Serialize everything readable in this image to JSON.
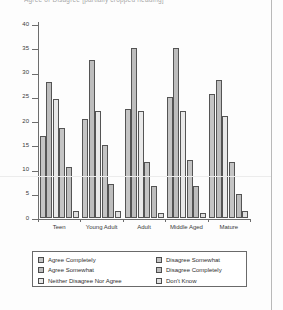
{
  "title_fragment": "Agree or Disagree [partially cropped heading]",
  "chart_data": {
    "type": "bar",
    "title": "Agree or Disagree [partially cropped heading]",
    "xlabel": "",
    "ylabel": "",
    "ylim": [
      0,
      40
    ],
    "yticks": [
      0,
      5,
      10,
      15,
      20,
      25,
      30,
      35,
      40
    ],
    "grid": false,
    "legend_position": "bottom",
    "categories": [
      "Teen",
      "Young Adult",
      "Adult",
      "Middle Aged",
      "Mature"
    ],
    "series": [
      {
        "name": "Agree Completely",
        "values": [
          17,
          20.5,
          22.5,
          25,
          25.5
        ]
      },
      {
        "name": "Agree Somewhat",
        "values": [
          28,
          32.5,
          35,
          35,
          28.5
        ]
      },
      {
        "name": "Neither Disagree Nor Agree",
        "values": [
          24.5,
          22,
          22,
          22,
          21
        ]
      },
      {
        "name": "Disagree Somewhat",
        "values": [
          18.5,
          15,
          11.5,
          12,
          11.5
        ]
      },
      {
        "name": "Disagree Completely",
        "values": [
          10.5,
          7,
          6.5,
          6.5,
          5
        ]
      },
      {
        "name": "Don't Know",
        "values": [
          1.5,
          1.5,
          1,
          1,
          1.5
        ]
      }
    ]
  },
  "axis": {
    "y_labels": [
      "0",
      "5",
      "10",
      "15",
      "20",
      "25",
      "30",
      "35",
      "40"
    ],
    "categories": [
      "Teen",
      "Young Adult",
      "Adult",
      "Middle Aged",
      "Mature"
    ]
  },
  "legend": {
    "left_column": [
      "Agree Completely",
      "Agree Somewhat",
      "Neither Disagree Nor Agree"
    ],
    "right_column": [
      "Disagree Somewhat",
      "Disagree Completely",
      "Don't Know"
    ]
  },
  "colors": {
    "bar_fill": "#c4c4c4",
    "bar_fill_light": "#e9e9e9",
    "bar_outline": "#545454",
    "axis": "#6d6d6d",
    "text": "#2e2e2e"
  }
}
